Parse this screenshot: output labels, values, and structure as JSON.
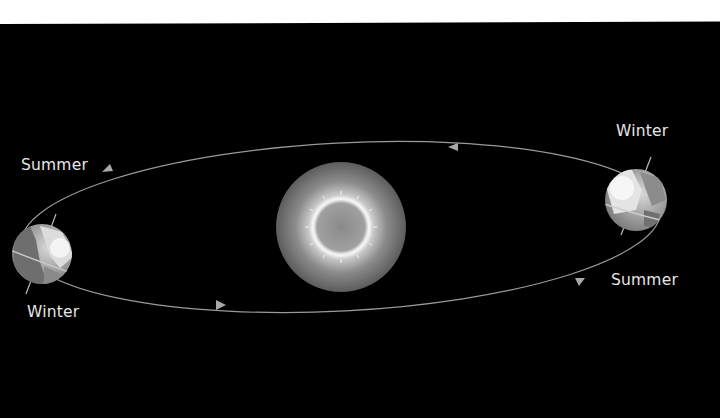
{
  "diagram": {
    "labels": {
      "left_top": "Summer",
      "left_bottom": "Winter",
      "right_top": "Winter",
      "right_bottom": "Summer"
    },
    "objects": {
      "sun": "sun",
      "earth_left": "earth",
      "earth_right": "earth",
      "orbit": "orbit-path"
    },
    "colors": {
      "background": "#000000",
      "orbit": "#9a9a9a",
      "label": "#e6e6e6",
      "sun_outer": "#6e6e6e",
      "sun_glow": "#f2f2f2"
    }
  }
}
